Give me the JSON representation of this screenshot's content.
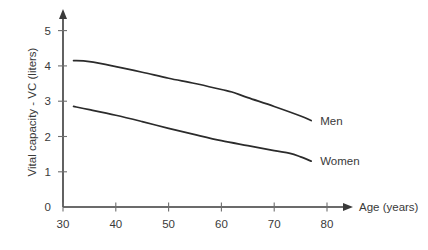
{
  "chart_data": {
    "type": "line",
    "title": "",
    "xlabel": "Age (years)",
    "ylabel": "Vital capacity - VC (liters)",
    "xlim": [
      30,
      82
    ],
    "ylim": [
      0,
      5
    ],
    "grid": false,
    "legend_position": "right-inline",
    "xticks": [
      30,
      40,
      50,
      60,
      70,
      80
    ],
    "xtick_labels": [
      "30",
      "40",
      "50",
      "60",
      "70",
      "80"
    ],
    "yticks": [
      0,
      1,
      2,
      3,
      4,
      5
    ],
    "ytick_labels": [
      "0",
      "1",
      "2",
      "3",
      "4",
      "5"
    ],
    "series": [
      {
        "name": "Men",
        "label": "Men",
        "color": "#2b2b2b",
        "x": [
          32,
          35,
          40,
          45,
          50,
          55,
          60,
          62,
          65,
          70,
          75,
          77
        ],
        "values": [
          4.15,
          4.12,
          3.98,
          3.82,
          3.65,
          3.5,
          3.33,
          3.26,
          3.1,
          2.85,
          2.58,
          2.45
        ]
      },
      {
        "name": "Women",
        "label": "Women",
        "color": "#2b2b2b",
        "x": [
          32,
          35,
          40,
          45,
          50,
          55,
          60,
          65,
          70,
          73,
          75,
          77
        ],
        "values": [
          2.85,
          2.76,
          2.6,
          2.42,
          2.23,
          2.05,
          1.88,
          1.74,
          1.6,
          1.52,
          1.42,
          1.3
        ]
      }
    ]
  },
  "axes": {
    "y_axis_title": "Vital capacity - VC (liters)",
    "x_axis_title": "Age (years)"
  },
  "labels": {
    "men": "Men",
    "women": "Women"
  },
  "colors": {
    "line": "#2b2b2b",
    "axis": "#3a3a3a",
    "text": "#3a3a3a",
    "background": "#ffffff"
  }
}
